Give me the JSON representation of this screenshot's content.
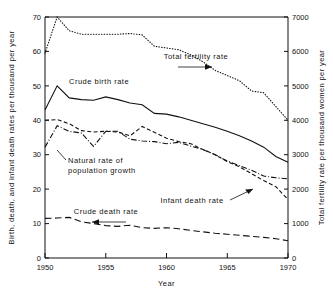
{
  "chart_data": {
    "type": "line",
    "title": "",
    "xlabel": "Year",
    "ylabel": "Birth, death, and infant death rates per thousand per year",
    "y2label": "Total fertility rate per thousand women per year",
    "xlim": [
      1950,
      1970
    ],
    "ylim": [
      0,
      70
    ],
    "y2lim": [
      0,
      7000
    ],
    "grid": false,
    "legend_position": "inline-annotations",
    "xticks": [
      "1950",
      "1955",
      "1960",
      "1965",
      "1970"
    ],
    "xtick_values": [
      1950,
      1955,
      1960,
      1965,
      1970
    ],
    "yticks": [
      "0",
      "10",
      "20",
      "30",
      "40",
      "50",
      "60",
      "70"
    ],
    "ytick_values": [
      0,
      10,
      20,
      30,
      40,
      50,
      60,
      70
    ],
    "y2ticks": [
      "0",
      "1000",
      "2000",
      "3000",
      "4000",
      "5000",
      "6000",
      "7000"
    ],
    "y2tick_values": [
      0,
      1000,
      2000,
      3000,
      4000,
      5000,
      6000,
      7000
    ],
    "x": [
      1950,
      1951,
      1952,
      1953,
      1954,
      1955,
      1956,
      1957,
      1958,
      1959,
      1960,
      1961,
      1962,
      1963,
      1964,
      1965,
      1966,
      1967,
      1968,
      1969,
      1970
    ],
    "series": [
      {
        "name": "Total fertility rate",
        "axis": "right",
        "style": "dotted",
        "values": [
          5950,
          7000,
          6600,
          6500,
          6500,
          6500,
          6500,
          6520,
          6480,
          6150,
          6100,
          6050,
          5900,
          5700,
          5450,
          5300,
          5150,
          4850,
          4800,
          4400,
          4000
        ]
      },
      {
        "name": "Crude birth rate",
        "axis": "left",
        "style": "solid",
        "values": [
          43.0,
          50.0,
          46.5,
          46.0,
          45.8,
          46.8,
          46.0,
          45.0,
          44.5,
          42.0,
          41.8,
          41.0,
          40.0,
          39.0,
          38.0,
          36.8,
          35.5,
          34.0,
          32.2,
          29.5,
          27.8
        ]
      },
      {
        "name": "Infant death rate",
        "axis": "left",
        "style": "dashed",
        "values": [
          40.0,
          40.2,
          39.0,
          37.0,
          36.6,
          36.8,
          36.6,
          35.5,
          38.2,
          36.5,
          34.8,
          33.8,
          33.2,
          31.5,
          30.0,
          28.0,
          26.5,
          24.5,
          22.5,
          20.7,
          17.0
        ]
      },
      {
        "name": "Natural rate of population growth",
        "axis": "left",
        "style": "dashdot",
        "values": [
          32.2,
          38.4,
          36.8,
          36.3,
          32.4,
          36.8,
          36.8,
          34.5,
          34.0,
          33.8,
          33.2,
          33.6,
          32.5,
          31.5,
          30.0,
          28.2,
          26.8,
          25.5,
          23.8,
          23.3,
          23.0
        ]
      },
      {
        "name": "Crude death rate",
        "axis": "left",
        "style": "longdash",
        "values": [
          11.5,
          11.6,
          11.8,
          10.5,
          10.0,
          9.4,
          9.2,
          9.5,
          8.8,
          8.6,
          8.8,
          8.5,
          8.0,
          7.6,
          7.2,
          6.9,
          6.6,
          6.3,
          6.0,
          5.6,
          5.0
        ]
      }
    ],
    "annotations": [
      {
        "name": "Total fertility rate",
        "text": "Total fertility rate",
        "arrow": "right"
      },
      {
        "name": "Crude birth rate",
        "text": "Crude birth rate",
        "arrow": "none"
      },
      {
        "name": "Natural rate of population growth",
        "text_line1": "Natural rate of",
        "text_line2": "population growth",
        "arrow": "leader"
      },
      {
        "name": "Infant death rate",
        "text": "Infant death rate",
        "arrow": "leader"
      },
      {
        "name": "Crude death rate",
        "text": "Crude death rate",
        "arrow": "left"
      }
    ]
  }
}
